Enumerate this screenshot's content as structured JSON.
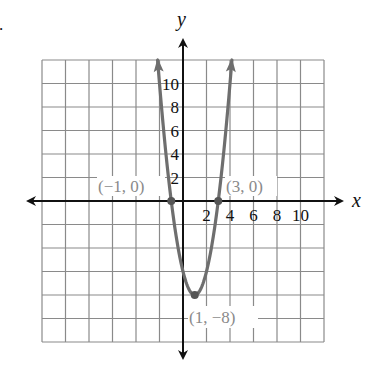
{
  "chart_data": {
    "type": "line",
    "title": "",
    "function": "y = 2(x - 1)^2 - 8",
    "xlabel": "x",
    "ylabel": "y",
    "xlim": [
      -12,
      12
    ],
    "ylim": [
      -12,
      12
    ],
    "grid": true,
    "grid_step": 2,
    "x_tick_labels": [
      "2",
      "4",
      "6",
      "8",
      "10"
    ],
    "y_tick_labels": [
      "2",
      "4",
      "6",
      "8",
      "10"
    ],
    "x_ticks": [
      2,
      4,
      6,
      8,
      10
    ],
    "y_ticks": [
      2,
      4,
      6,
      8,
      10
    ],
    "series": [
      {
        "name": "parabola",
        "x": [
          -2.16,
          -2,
          -1.5,
          -1,
          -0.5,
          0,
          0.5,
          1,
          1.5,
          2,
          2.5,
          3,
          3.5,
          4,
          4.16
        ],
        "y": [
          12,
          10,
          4.5,
          0,
          -3.5,
          -6,
          -7.5,
          -8,
          -7.5,
          -6,
          -3.5,
          0,
          4.5,
          10,
          12
        ],
        "color": "#6e6e6e"
      }
    ],
    "annotations": [
      {
        "label": "(−1, 0)",
        "x": -1,
        "y": 0
      },
      {
        "label": "(3, 0)",
        "x": 3,
        "y": 0
      },
      {
        "label": "(1, −8)",
        "x": 1,
        "y": -8
      }
    ]
  },
  "labels": {
    "x_axis": "x",
    "y_axis": "y",
    "root_left": "(−1, 0)",
    "root_right": "(3, 0)",
    "vertex": "(1, −8)",
    "problem_marker": "."
  },
  "ticks": {
    "x": [
      "2",
      "4",
      "6",
      "8",
      "10"
    ],
    "y": [
      "2",
      "4",
      "6",
      "8",
      "10"
    ]
  },
  "colors": {
    "curve": "#6e6e6e",
    "grid": "#8a8a8a",
    "axis": "#111111",
    "point_label": "#8a8a8a"
  }
}
